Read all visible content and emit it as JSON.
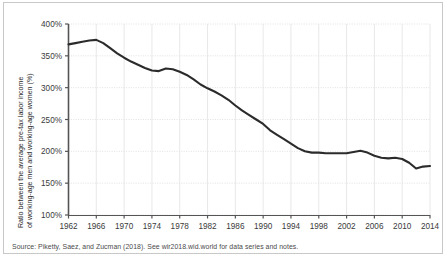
{
  "chart_data": {
    "type": "line",
    "title": "",
    "xlabel": "",
    "ylabel": "Ratio between the average pre-tax labor income of working-age men and working-age women (%)",
    "ylabel_line1": "Ratio between the average pre-tax labor income",
    "ylabel_line2": "of working-age men and working-age women (%)",
    "xlim": [
      1962,
      2014
    ],
    "ylim": [
      100,
      400
    ],
    "grid": true,
    "legend": "none",
    "line_color": "#2b2b2b",
    "ytick_labels": [
      "100%",
      "150%",
      "200%",
      "250%",
      "300%",
      "350%",
      "400%"
    ],
    "ytick_values": [
      100,
      150,
      200,
      250,
      300,
      350,
      400
    ],
    "xtick_labels": [
      "1962",
      "1966",
      "1970",
      "1974",
      "1978",
      "1982",
      "1986",
      "1990",
      "1994",
      "1998",
      "2002",
      "2006",
      "2010",
      "2014"
    ],
    "xtick_values": [
      1962,
      1966,
      1970,
      1974,
      1978,
      1982,
      1986,
      1990,
      1994,
      1998,
      2002,
      2006,
      2010,
      2014
    ],
    "x": [
      1962,
      1963,
      1964,
      1965,
      1966,
      1967,
      1968,
      1969,
      1970,
      1971,
      1972,
      1973,
      1974,
      1975,
      1976,
      1977,
      1978,
      1979,
      1980,
      1981,
      1982,
      1983,
      1984,
      1985,
      1986,
      1987,
      1988,
      1989,
      1990,
      1991,
      1992,
      1993,
      1994,
      1995,
      1996,
      1997,
      1998,
      1999,
      2000,
      2001,
      2002,
      2003,
      2004,
      2005,
      2006,
      2007,
      2008,
      2009,
      2010,
      2011,
      2012,
      2013,
      2014
    ],
    "values": [
      368,
      370,
      372,
      374,
      375,
      370,
      362,
      354,
      347,
      341,
      336,
      331,
      327,
      326,
      330,
      329,
      325,
      320,
      313,
      305,
      299,
      294,
      288,
      281,
      272,
      264,
      257,
      250,
      243,
      233,
      226,
      219,
      212,
      205,
      200,
      198,
      198,
      197,
      197,
      197,
      197,
      199,
      201,
      198,
      193,
      190,
      189,
      190,
      188,
      182,
      173,
      176,
      177
    ],
    "series_name": "Gender pre-tax labor income ratio"
  },
  "source": {
    "note": "Source: Piketty, Saez, and Zucman (2018). See wir2018.wid.world for data series and notes."
  }
}
